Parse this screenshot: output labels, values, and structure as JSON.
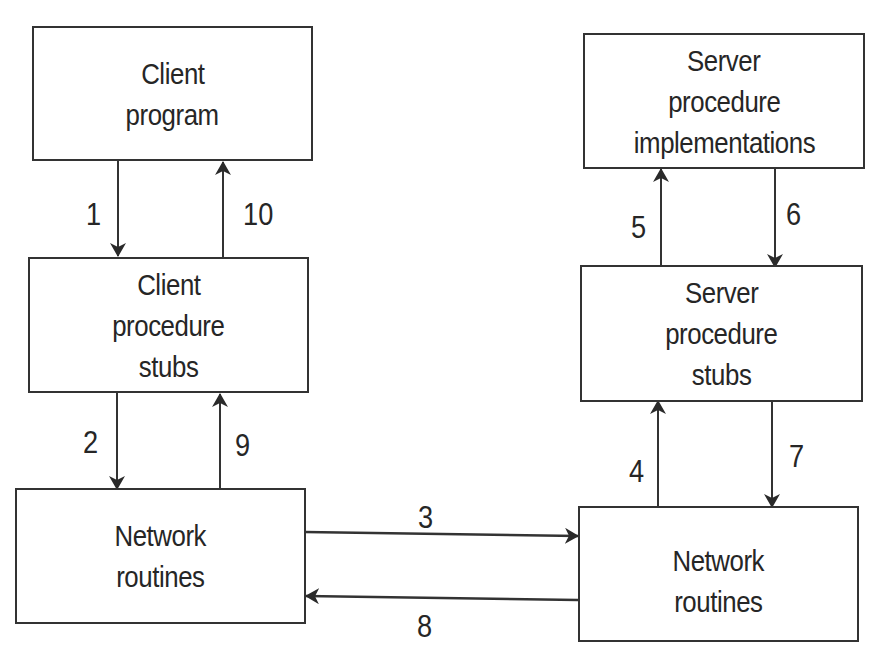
{
  "diagram": {
    "type": "rpc-flow",
    "boxes": {
      "client_program": [
        "Client",
        "program"
      ],
      "client_stubs": [
        "Client",
        "procedure",
        "stubs"
      ],
      "client_network": [
        "Network",
        "routines"
      ],
      "server_impl": [
        "Server",
        "procedure",
        "implementations"
      ],
      "server_stubs": [
        "Server",
        "procedure",
        "stubs"
      ],
      "server_network": [
        "Network",
        "routines"
      ]
    },
    "steps": {
      "s1": "1",
      "s2": "2",
      "s3": "3",
      "s4": "4",
      "s5": "5",
      "s6": "6",
      "s7": "7",
      "s8": "8",
      "s9": "9",
      "s10": "10"
    },
    "edges": [
      {
        "label": "1",
        "from": "Client program",
        "to": "Client procedure stubs"
      },
      {
        "label": "2",
        "from": "Client procedure stubs",
        "to": "Network routines (client)"
      },
      {
        "label": "3",
        "from": "Network routines (client)",
        "to": "Network routines (server)"
      },
      {
        "label": "4",
        "from": "Network routines (server)",
        "to": "Server procedure stubs"
      },
      {
        "label": "5",
        "from": "Server procedure stubs",
        "to": "Server procedure implementations"
      },
      {
        "label": "6",
        "from": "Server procedure implementations",
        "to": "Server procedure stubs"
      },
      {
        "label": "7",
        "from": "Server procedure stubs",
        "to": "Network routines (server)"
      },
      {
        "label": "8",
        "from": "Network routines (server)",
        "to": "Network routines (client)"
      },
      {
        "label": "9",
        "from": "Network routines (client)",
        "to": "Client procedure stubs"
      },
      {
        "label": "10",
        "from": "Client procedure stubs",
        "to": "Client program"
      }
    ],
    "colors": {
      "stroke": "#333333",
      "text": "#262626",
      "background": "#ffffff"
    }
  }
}
